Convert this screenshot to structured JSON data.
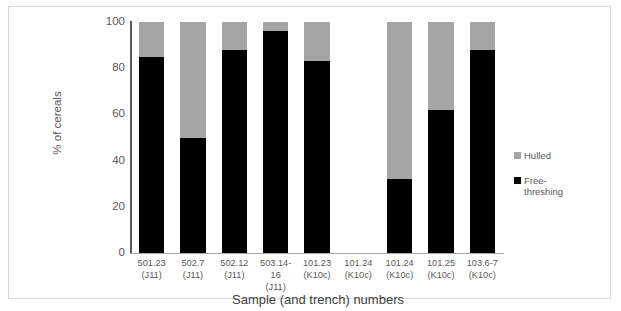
{
  "chart_data": {
    "type": "bar",
    "subtype": "stacked-bar-100-percent",
    "title": "",
    "xlabel": "Sample (and trench) numbers",
    "ylabel": "% of cereals",
    "ylim": [
      0,
      100
    ],
    "yticks": [
      0,
      20,
      40,
      60,
      80,
      100
    ],
    "grid": false,
    "legend_position": "right",
    "categories": [
      "501.23 (J11)",
      "502.7 (J11)",
      "502.12 (J11)",
      "503.14-16 (J11)",
      "101.23 (K10c)",
      "101.24 (K10c)",
      "101.24 (K10c)",
      "101.25 (K10c)",
      "103.6-7 (K10c)"
    ],
    "category_lines": [
      [
        "501.23",
        "(J11)"
      ],
      [
        "502.7 (J11)",
        ""
      ],
      [
        "502.12",
        "(J11)"
      ],
      [
        "503.14-16",
        "(J11)"
      ],
      [
        "101.23",
        "(K10c)"
      ],
      [
        "101.24",
        "(K10c)"
      ],
      [
        "101.24",
        "(K10c)"
      ],
      [
        "101.25",
        "(K10c)"
      ],
      [
        "103.6-7",
        "(K10c)"
      ]
    ],
    "series": [
      {
        "name": "Free-threshing",
        "color": "#000000",
        "values": [
          85,
          50,
          88,
          96,
          83,
          0,
          32,
          62,
          88
        ]
      },
      {
        "name": "Hulled",
        "color": "#a5a5a5",
        "values": [
          15,
          50,
          12,
          4,
          17,
          0,
          68,
          38,
          12
        ]
      }
    ]
  },
  "axes": {
    "y_title": "% of cereals",
    "x_title": "Sample (and trench) numbers",
    "y_tick_labels": [
      "100",
      "80",
      "60",
      "40",
      "20",
      "0"
    ]
  },
  "legend": {
    "items": [
      {
        "label": "Hulled",
        "color": "#a5a5a5"
      },
      {
        "label": "Free-\nthreshing",
        "line1": "Free-",
        "line2": "threshing",
        "color": "#000000"
      }
    ]
  },
  "colors": {
    "hulled": "#a5a5a5",
    "free_threshing": "#000000",
    "axis": "#595959",
    "frame": "#d8d8d8",
    "background": "#ffffff"
  }
}
